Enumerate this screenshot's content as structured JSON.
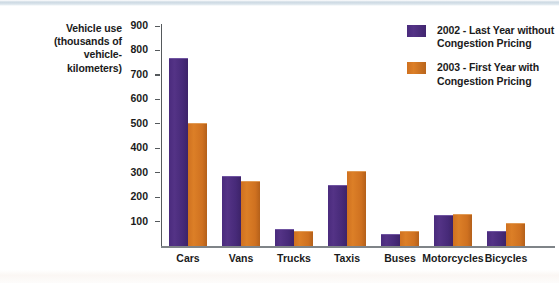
{
  "chart_data": {
    "type": "bar",
    "title": "",
    "xlabel": "",
    "ylabel": "Vehicle use (thousands of vehicle-kilometers)",
    "ylim": [
      0,
      900
    ],
    "ytick_step": 100,
    "yticks": [
      900,
      800,
      700,
      600,
      500,
      400,
      300,
      200,
      100
    ],
    "grid": false,
    "legend_position": "top-right",
    "categories": [
      "Cars",
      "Vans",
      "Trucks",
      "Taxis",
      "Buses",
      "Motorcycles",
      "Bicycles"
    ],
    "series": [
      {
        "name": "2002 - Last Year without Congestion Pricing",
        "color": "#4A2B7D",
        "values": [
          770,
          285,
          70,
          250,
          48,
          125,
          62
        ]
      },
      {
        "name": "2003 - First Year with Congestion Pricing",
        "color": "#CF7120",
        "values": [
          505,
          265,
          62,
          305,
          62,
          133,
          95
        ]
      }
    ]
  },
  "axis": {
    "y_title_lines": [
      "Vehicle use",
      "(thousands of",
      "vehicle-",
      "kilometers)"
    ]
  },
  "legend": {
    "items": [
      {
        "swatch": "swatch-a",
        "line1": "2002 - Last Year without",
        "line2": "Congestion Pricing"
      },
      {
        "swatch": "swatch-b",
        "line1": "2003 - First Year with",
        "line2": "Congestion Pricing"
      }
    ]
  }
}
